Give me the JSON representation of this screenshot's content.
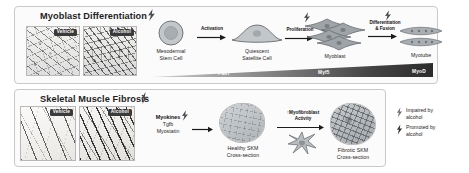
{
  "figure": {
    "panels": [
      {
        "id": "myoblast-differentiation",
        "title": "Myoblast Differentiation"
      },
      {
        "id": "skeletal-muscle-fibrosis",
        "title": "Skeletal Muscle Fibrosis"
      }
    ]
  },
  "top_panel": {
    "title": "Myoblast Differentiation",
    "micrographs": [
      {
        "label": "Vehicle"
      },
      {
        "label": "Alcohol"
      }
    ],
    "stages": [
      {
        "name": "Mesodermal\nStem Cell"
      },
      {
        "name": "Quiescent\nSatellite Cell"
      },
      {
        "name": "Myoblast"
      },
      {
        "name": "Myotube"
      }
    ],
    "transitions": [
      {
        "label": "Activation"
      },
      {
        "label": "Proliferation"
      },
      {
        "label": "Differentiation\n& Fusion"
      }
    ],
    "tf_bar": {
      "markers": [
        "Pax7",
        "Myf5",
        "MyoD"
      ]
    }
  },
  "bottom_panel": {
    "title": "Skeletal Muscle Fibrosis",
    "micrographs": [
      {
        "label": "Vehicle"
      },
      {
        "label": "Alcohol"
      }
    ],
    "factors": {
      "heading": "Myokines",
      "items": [
        "Tgfb",
        "Myostatin"
      ]
    },
    "cross_sections": [
      {
        "caption": "Healthy SKM\nCross-section"
      },
      {
        "caption": "Fibrotic SKM\nCross-section"
      }
    ],
    "activity": {
      "label": "↑Myofibroblast\nActivity"
    }
  },
  "legend": {
    "items": [
      {
        "icon": "lightning-bolt-impaired-icon",
        "text": "Impaired by\nalcohol"
      },
      {
        "icon": "lightning-bolt-promoted-icon",
        "text": "Promoted by\nalcohol"
      }
    ]
  },
  "colors": {
    "panel_border": "#c9c9c9",
    "panel_fill": "#fbfbfb",
    "text": "#1f1f1f",
    "cell_fill": "#b9bdc0",
    "cell_stroke": "#6f7478",
    "bar_dark": "#2c2c2c",
    "bar_light": "#cfcfcf"
  }
}
